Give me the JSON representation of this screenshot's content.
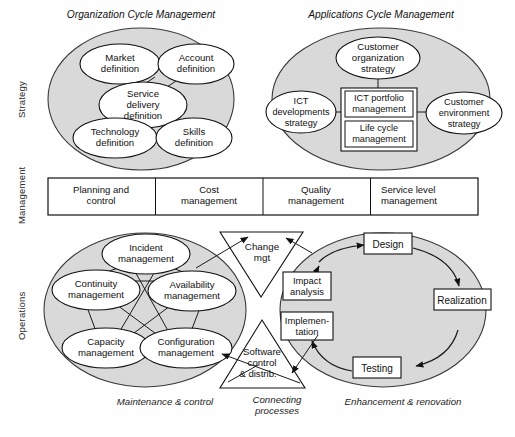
{
  "diagram": {
    "title_left_top": "Organization Cycle Management",
    "title_right_top": "Applications Cycle Management",
    "row_labels": [
      "Strategy",
      "Management",
      "Operations"
    ],
    "bottom_captions": {
      "left": "Maintenance & control",
      "center_line1": "Connecting",
      "center_line2": "processes",
      "right": "Enhancement & renovation"
    },
    "colors": {
      "ellipse_fill": "#d9d9d9",
      "ellipse_stroke": "#333333",
      "node_fill": "#ffffff",
      "node_stroke": "#111111",
      "text": "#111111",
      "page_background": "#fefefe"
    },
    "strategy": {
      "organization_cycle": {
        "nodes": [
          {
            "id": "market-definition",
            "line1": "Market",
            "line2": "definition"
          },
          {
            "id": "account-definition",
            "line1": "Account",
            "line2": "definition"
          },
          {
            "id": "service-delivery-definition",
            "line1": "Service",
            "line2": "delivery",
            "line3": "definition"
          },
          {
            "id": "technology-definition",
            "line1": "Technology",
            "line2": "definition"
          },
          {
            "id": "skills-definition",
            "line1": "Skills",
            "line2": "definition"
          }
        ]
      },
      "applications_cycle": {
        "nodes": [
          {
            "id": "customer-organization-strategy",
            "line1": "Customer",
            "line2": "organization",
            "line3": "strategy"
          },
          {
            "id": "ict-developments-strategy",
            "line1": "ICT",
            "line2": "developments",
            "line3": "strategy"
          },
          {
            "id": "customer-environment-strategy",
            "line1": "Customer",
            "line2": "environment",
            "line3": "strategy"
          }
        ],
        "boxes": [
          {
            "id": "ict-portfolio-management",
            "line1": "ICT portfolio",
            "line2": "management"
          },
          {
            "id": "life-cycle-management",
            "line1": "Life cycle",
            "line2": "management"
          }
        ]
      }
    },
    "management_band": {
      "cells": [
        {
          "id": "planning-and-control",
          "line1": "Planning and",
          "line2": "control"
        },
        {
          "id": "cost-management",
          "line1": "Cost",
          "line2": "management"
        },
        {
          "id": "quality-management",
          "line1": "Quality",
          "line2": "management"
        },
        {
          "id": "service-level-management",
          "line1": "Service level",
          "line2": "management"
        }
      ]
    },
    "operations": {
      "maintenance_control": {
        "nodes": [
          {
            "id": "incident-management",
            "line1": "Incident",
            "line2": "management"
          },
          {
            "id": "continuity-management",
            "line1": "Continuity",
            "line2": "management"
          },
          {
            "id": "availability-management",
            "line1": "Availability",
            "line2": "management"
          },
          {
            "id": "capacity-management",
            "line1": "Capacity",
            "line2": "management"
          },
          {
            "id": "configuration-management",
            "line1": "Configuration",
            "line2": "management"
          }
        ]
      },
      "enhancement_renovation": {
        "nodes": [
          {
            "id": "design",
            "line1": "Design"
          },
          {
            "id": "realization",
            "line1": "Realization"
          },
          {
            "id": "testing",
            "line1": "Testing"
          },
          {
            "id": "implementation",
            "line1": "Implemen-",
            "line2": "tation"
          },
          {
            "id": "impact-analysis",
            "line1": "Impact",
            "line2": "analysis"
          }
        ]
      },
      "connecting_processes": [
        {
          "id": "change-mgt",
          "line1": "Change",
          "line2": "mgt"
        },
        {
          "id": "software-control-distrib",
          "line1": "Software",
          "line2": "control",
          "line3": "& distrib."
        }
      ]
    }
  }
}
